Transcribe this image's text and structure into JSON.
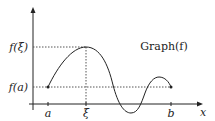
{
  "diagram": {
    "axes": {
      "x_label": "x",
      "y_label": ""
    },
    "x_ticks": [
      "a",
      "ξ",
      "b"
    ],
    "y_ticks": [
      "f(ξ)",
      "f(a)"
    ],
    "curve_label": "Graph(f)",
    "colors": {
      "stroke": "#222222",
      "guide": "#555555",
      "background": "#ffffff"
    }
  }
}
